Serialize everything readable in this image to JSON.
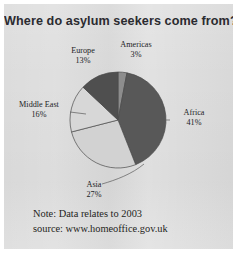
{
  "figure": {
    "title": "Where do asylum seekers come from?",
    "note_lines": [
      "Note: Data relates to 2003",
      "source: www.homeoffice.gov.uk"
    ]
  },
  "labels": {
    "europe": {
      "name": "Europe",
      "pct": "13%"
    },
    "americas": {
      "name": "Americas",
      "pct": "3%"
    },
    "africa": {
      "name": "Africa",
      "pct": "41%"
    },
    "asia": {
      "name": "Asia",
      "pct": "27%"
    },
    "middle_east": {
      "name": "Middle East",
      "pct": "16%"
    }
  },
  "chart_data": {
    "type": "pie",
    "title": "Where do asylum seekers come from?",
    "subtitle": "",
    "xlabel": "",
    "ylabel": "",
    "unit": "percent",
    "grid": false,
    "legend": false,
    "labels_position": "outside-callout",
    "start_angle_deg": 0,
    "direction": "clockwise",
    "categories": [
      "Americas",
      "Africa",
      "Asia",
      "Middle East",
      "Europe"
    ],
    "values": [
      3,
      41,
      27,
      16,
      13
    ],
    "total": 100,
    "slices": [
      {
        "label": "Americas",
        "value": 3,
        "display": "3%",
        "color": "#8d8d8d",
        "start_deg": 0,
        "end_deg": 10.8
      },
      {
        "label": "Africa",
        "value": 41,
        "display": "41%",
        "color": "#585858",
        "start_deg": 10.8,
        "end_deg": 158.4
      },
      {
        "label": "Asia",
        "value": 27,
        "display": "27%",
        "color": "#d2d2d2",
        "start_deg": 158.4,
        "end_deg": 255.6
      },
      {
        "label": "Middle East",
        "value": 16,
        "display": "16%",
        "color": "#d7d7d7",
        "start_deg": 255.6,
        "end_deg": 313.2
      },
      {
        "label": "Europe",
        "value": 13,
        "display": "13%",
        "color": "#4f4f4f",
        "start_deg": 313.2,
        "end_deg": 360
      }
    ],
    "annotations": [
      "Note: Data relates to 2003",
      "source: www.homeoffice.gov.uk"
    ]
  },
  "colors": {
    "page_background": "#ffffff",
    "panel_background": "#dcdcdc",
    "title_text": "#2b2b30",
    "label_text": "#232326",
    "note_text": "#1f1f22",
    "slice_outline": "#4a4a4a",
    "leader_line": "#5a5a5a"
  }
}
